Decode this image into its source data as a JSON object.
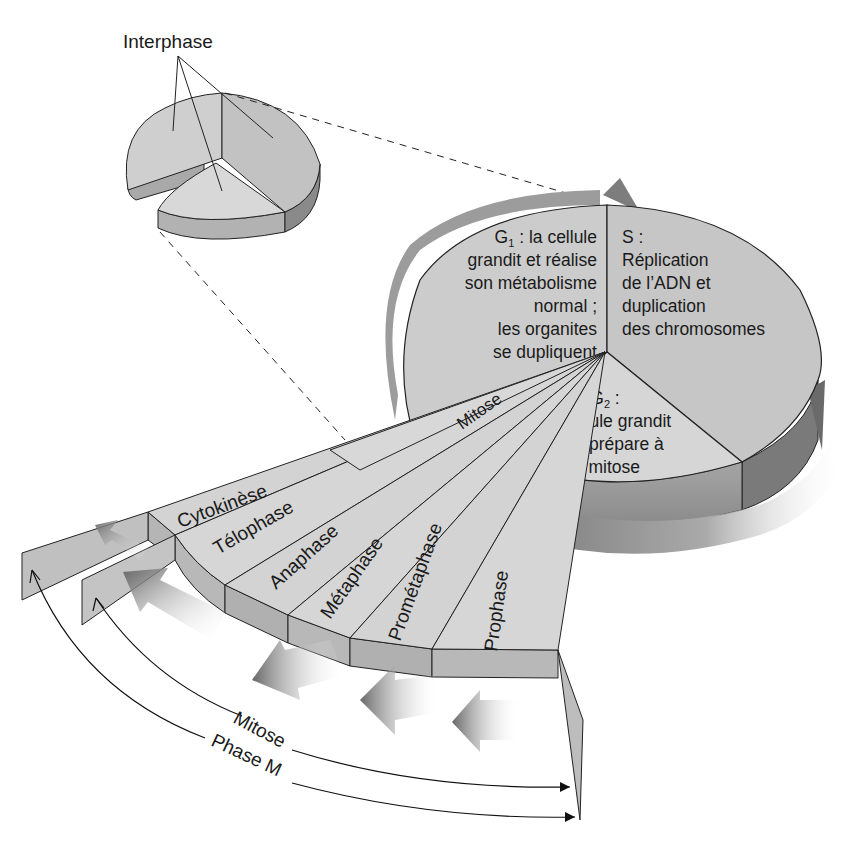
{
  "small_pie": {
    "title": "Interphase"
  },
  "large_pie": {
    "g1": {
      "heading": "G",
      "subscript": "1",
      "heading_suffix": " : la cellule",
      "lines": [
        "grandit et réalise",
        "son métabolisme",
        "normal ;",
        "les organites",
        "se  dupliquent"
      ]
    },
    "s": {
      "heading": "S :",
      "lines": [
        "Réplication",
        "de l’ADN et",
        "duplication",
        "des chromosomes"
      ]
    },
    "g2": {
      "heading": "G",
      "subscript": "2",
      "heading_suffix": " :",
      "lines": [
        "La cellule grandit",
        "et se prépare à",
        "la mitose"
      ]
    },
    "mitose_wedge_label": "Mitose"
  },
  "mitosis_fan": {
    "stages": [
      "Cytokinèse",
      "Télophase",
      "Anaphase",
      "Métaphase",
      "Prométaphase",
      "Prophase"
    ]
  },
  "brackets": {
    "mitose": "Mitose",
    "phase_m": "Phase M"
  },
  "colors": {
    "face_light": "#d4d4d4",
    "face_mid": "#c4c4c4",
    "side_dark": "#9a9a9a",
    "side_darker": "#7d7d7d",
    "arrow_dark": "#6e6e6e",
    "line": "#1a1a1a"
  }
}
